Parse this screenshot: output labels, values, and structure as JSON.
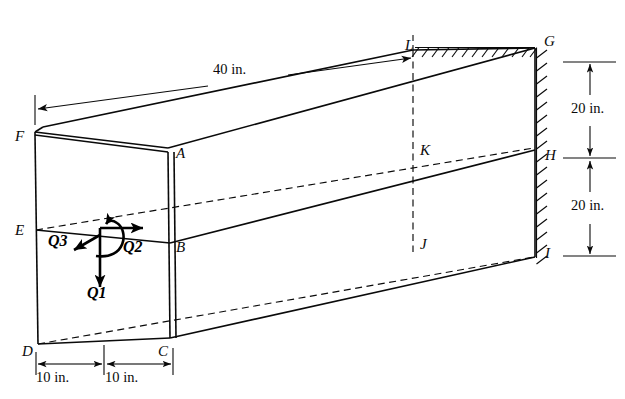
{
  "figure": {
    "background_color": "#ffffff",
    "line_color": "#0a0a0a",
    "width": 625,
    "height": 399
  },
  "vertex_labels": {
    "A": "A",
    "B": "B",
    "C": "C",
    "D": "D",
    "E": "E",
    "F": "F",
    "G": "G",
    "H": "H",
    "I": "I",
    "J": "J",
    "K": "K",
    "L": "L"
  },
  "dimensions": {
    "length": "40 in.",
    "upper_height": "20 in.",
    "lower_height": "20 in.",
    "width_left": "10 in.",
    "width_right": "10 in."
  },
  "loads": {
    "q1": "Q",
    "q1_sub": "1",
    "q2": "Q",
    "q2_sub": "2",
    "q3": "Q",
    "q3_sub": "3"
  },
  "icons": {
    "arrow_head": "arrowhead-icon",
    "moment_arc": "moment-arc-icon",
    "wall_hatching": "fixed-support-hatching-icon"
  }
}
